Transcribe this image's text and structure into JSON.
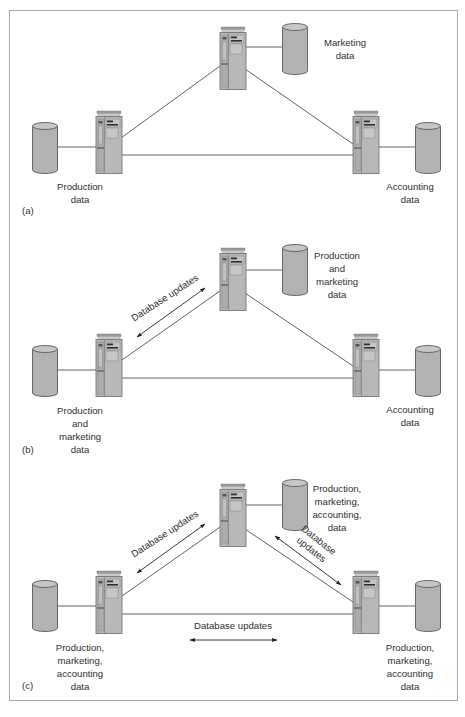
{
  "figure": {
    "panels": [
      {
        "id": "a",
        "letter": "(a)",
        "nodes": {
          "top": {
            "label": "Marketing\ndata"
          },
          "left": {
            "label": "Production\ndata"
          },
          "right": {
            "label": "Accounting\ndata"
          }
        },
        "annotations": []
      },
      {
        "id": "b",
        "letter": "(b)",
        "nodes": {
          "top": {
            "label": "Production\nand\nmarketing\ndata"
          },
          "left": {
            "label": "Production\nand\nmarketing\ndata"
          },
          "right": {
            "label": "Accounting\ndata"
          }
        },
        "annotations": [
          {
            "edge": "left-top",
            "label": "Database updates"
          }
        ]
      },
      {
        "id": "c",
        "letter": "(c)",
        "nodes": {
          "top": {
            "label": "Production,\nmarketing,\naccounting,\ndata"
          },
          "left": {
            "label": "Production,\nmarketing,\naccounting\ndata"
          },
          "right": {
            "label": "Production,\nmarketing,\naccounting\ndata"
          }
        },
        "annotations": [
          {
            "edge": "left-top",
            "label": "Database updates"
          },
          {
            "edge": "top-right",
            "label": "Database\nupdates"
          },
          {
            "edge": "left-right",
            "label": "Database updates"
          }
        ]
      }
    ],
    "colors": {
      "cylinder_fill": "#b3b3b3",
      "cylinder_stroke": "#5a5a5a",
      "computer_fill": "#b8b8b8",
      "line": "#3a3a3a",
      "frame": "#a9a9a9"
    },
    "icons": {
      "computer": "server-tower-icon",
      "database": "database-cylinder-icon"
    }
  }
}
